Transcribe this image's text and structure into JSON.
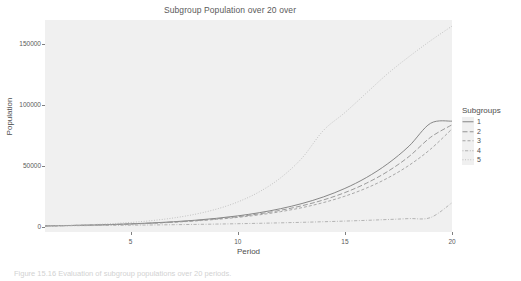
{
  "chart_data": {
    "type": "line",
    "title": "Subgroup Population over 20 over",
    "xlabel": "Period",
    "ylabel": "Population",
    "xlim": [
      1,
      20
    ],
    "ylim": [
      -4000,
      170000
    ],
    "grid": false,
    "legend_position": "right",
    "legend_title": "Subgroups",
    "x": [
      1,
      2,
      3,
      4,
      5,
      6,
      7,
      8,
      9,
      10,
      11,
      12,
      13,
      14,
      15,
      16,
      17,
      18,
      19,
      20
    ],
    "xticks": [
      5,
      10,
      15,
      20
    ],
    "xtick_labels": [
      "5",
      "10",
      "15",
      "20"
    ],
    "yticks": [
      0,
      50000,
      100000,
      150000
    ],
    "ytick_labels": [
      "0",
      "50000",
      "100000",
      "150000"
    ],
    "series": [
      {
        "name": "1",
        "dash": "solid",
        "color": "#7a7a7a",
        "values": [
          1000,
          1280,
          1640,
          2100,
          2690,
          3440,
          4410,
          5640,
          7220,
          9240,
          11830,
          15140,
          19380,
          24810,
          31760,
          40650,
          52030,
          66590,
          85230,
          87000
        ]
      },
      {
        "name": "2",
        "dash": "longdash",
        "color": "#8a8a8a",
        "values": [
          1000,
          1270,
          1610,
          2050,
          2600,
          3300,
          4190,
          5320,
          6760,
          8580,
          10900,
          13840,
          17580,
          22320,
          28350,
          36000,
          45720,
          58060,
          73730,
          84000
        ]
      },
      {
        "name": "3",
        "dash": "dashed",
        "color": "#9a9a9a",
        "values": [
          1000,
          1260,
          1590,
          2000,
          2520,
          3180,
          4000,
          5040,
          6350,
          8000,
          10080,
          12700,
          16000,
          20160,
          25400,
          32000,
          40320,
          50800,
          64000,
          80600
        ]
      },
      {
        "name": "4",
        "dash": "dotdash",
        "color": "#a8a8a8",
        "values": [
          1000,
          1120,
          1260,
          1410,
          1580,
          1770,
          1990,
          2230,
          2500,
          2800,
          3140,
          3520,
          3950,
          4430,
          4960,
          5560,
          6240,
          7000,
          7850,
          20000
        ]
      },
      {
        "name": "5",
        "dash": "dotted",
        "color": "#b4b4b4",
        "values": [
          1000,
          1400,
          1960,
          2740,
          3840,
          5380,
          7530,
          10540,
          14760,
          20660,
          28930,
          40500,
          56700,
          79380,
          94000,
          110000,
          126000,
          140000,
          153000,
          165000
        ]
      }
    ]
  },
  "caption": "Figure 15.16   Evaluation of subgroup populations over 20 periods."
}
